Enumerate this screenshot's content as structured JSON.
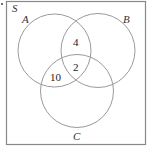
{
  "diagram": {
    "type": "venn",
    "universal_set_label": "S",
    "sets": [
      {
        "label": "A",
        "cx": 54.5,
        "cy": 50.5,
        "r": 36.5
      },
      {
        "label": "B",
        "cx": 98,
        "cy": 50.5,
        "r": 37
      },
      {
        "label": "C",
        "cx": 77,
        "cy": 91,
        "r": 36.5
      }
    ],
    "regions": [
      {
        "sets": [
          "A",
          "B"
        ],
        "exclusive": true,
        "value": "4"
      },
      {
        "sets": [
          "A",
          "B",
          "C"
        ],
        "value": "2"
      },
      {
        "sets": [
          "A",
          "C"
        ],
        "exclusive": true,
        "value": "10"
      }
    ],
    "colors": {
      "frame": "#888888",
      "circle": "#9a9a9a",
      "text": "#222222"
    }
  }
}
